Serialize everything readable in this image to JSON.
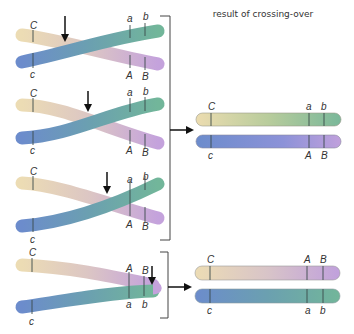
{
  "title": "result of crossing-over",
  "colors": {
    "cream": "#ecdcb4",
    "tan": "#dcc8b8",
    "lilac": "#c8a4d8",
    "teal": "#6aaa98",
    "blue": "#6c8ccc",
    "green": "#7ab89a",
    "purple": "#b89ad8",
    "arrow": "#111111",
    "bracket": "#444444",
    "text": "#333333"
  },
  "pairs": [
    {
      "label_C": "C",
      "label_c": "c",
      "label_a": "a",
      "label_b": "b",
      "label_A": "A",
      "label_B": "B",
      "crossover_position": "left"
    },
    {
      "label_C": "C",
      "label_c": "c",
      "label_a": "a",
      "label_b": "b",
      "label_A": "A",
      "label_B": "B",
      "crossover_position": "middle"
    },
    {
      "label_C": "C",
      "label_c": "c",
      "label_a": "a",
      "label_b": "b",
      "label_A": "A",
      "label_B": "B",
      "crossover_position": "right-middle"
    },
    {
      "label_C": "C",
      "label_c": "c",
      "label_A": "A",
      "label_B": "B",
      "label_a": "a",
      "label_b": "b",
      "crossover_position": "far-right"
    }
  ],
  "results": [
    {
      "top": {
        "left": "C",
        "m1": "a",
        "m2": "b"
      },
      "bottom": {
        "left": "c",
        "m1": "A",
        "m2": "B"
      }
    },
    {
      "top": {
        "left": "C",
        "m1": "A",
        "m2": "B"
      },
      "bottom": {
        "left": "c",
        "m1": "a",
        "m2": "b"
      }
    }
  ]
}
